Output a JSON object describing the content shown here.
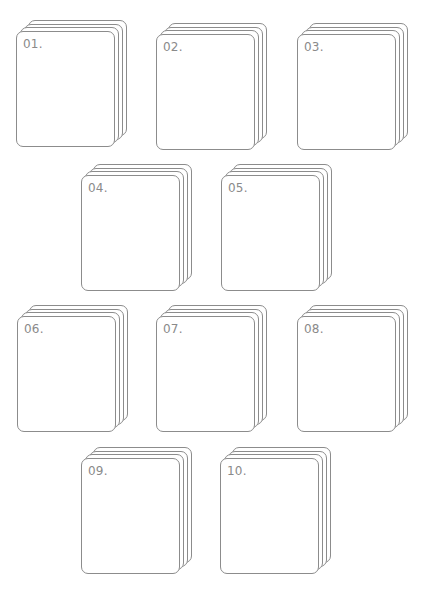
{
  "diagram": {
    "type": "numbered card stacks",
    "stroke_color": "#8c8c8c",
    "label_color": "#8a8a8a",
    "background": "#ffffff",
    "layers_per_stack": 4,
    "stacks": [
      {
        "label": "01.",
        "x": 16,
        "y": 20
      },
      {
        "label": "02.",
        "x": 156,
        "y": 23
      },
      {
        "label": "03.",
        "x": 297,
        "y": 23
      },
      {
        "label": "04.",
        "x": 81,
        "y": 164
      },
      {
        "label": "05.",
        "x": 221,
        "y": 164
      },
      {
        "label": "06.",
        "x": 17,
        "y": 305
      },
      {
        "label": "07.",
        "x": 156,
        "y": 305
      },
      {
        "label": "08.",
        "x": 297,
        "y": 305
      },
      {
        "label": "09.",
        "x": 81,
        "y": 447
      },
      {
        "label": "10.",
        "x": 220,
        "y": 447
      }
    ]
  }
}
